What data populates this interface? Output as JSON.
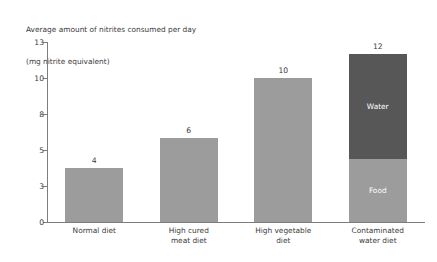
{
  "chart_data": {
    "type": "bar",
    "title": "Average amount of nitrites consumed per day",
    "subtitle": "(mg nitrite equivalent)",
    "xlabel": "",
    "ylabel": "",
    "categories": [
      "Normal diet",
      "High cured meat diet",
      "High vegetable diet",
      "Contaminated water diet"
    ],
    "category_lines": [
      [
        "Normal diet"
      ],
      [
        "High cured",
        "meat diet"
      ],
      [
        "High vegetable",
        "diet"
      ],
      [
        "Contaminated",
        "water diet"
      ]
    ],
    "values": [
      4,
      6,
      10,
      12
    ],
    "value_labels": [
      "4",
      "6",
      "10",
      "12"
    ],
    "ytick_labels": [
      "0",
      "3",
      "5",
      "8",
      "10",
      "13"
    ],
    "ytick_values": [
      0,
      3,
      5,
      8,
      10,
      13
    ],
    "ylim": [
      0,
      13
    ],
    "grid": false,
    "legend_position": "in-bar",
    "stacked_bar": {
      "category": "Contaminated water diet",
      "total": 12,
      "segments": [
        {
          "name": "Water",
          "value": 7.5,
          "color": "#575757"
        },
        {
          "name": "Food",
          "value": 4.5,
          "color": "#9c9c9c"
        }
      ]
    },
    "colors": {
      "bar": "#9c9c9c",
      "water_segment": "#575757",
      "axis": "#7d7d7d",
      "text": "#3b3b3b",
      "background": "#ffffff"
    }
  }
}
